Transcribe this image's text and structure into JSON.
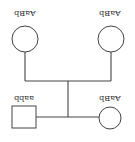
{
  "diagram": {
    "type": "pedigree",
    "orientation": "rotated-180",
    "colors": {
      "line": "#444444",
      "text": "#333333",
      "background": "#ffffff"
    },
    "parents": [
      {
        "id": "parent-left",
        "shape": "circle",
        "genotype": "AaBb"
      },
      {
        "id": "parent-right",
        "shape": "circle",
        "genotype": "AaBb"
      }
    ],
    "children": [
      {
        "id": "child-left",
        "shape": "square",
        "genotype": "aabb"
      },
      {
        "id": "child-right",
        "shape": "circle",
        "genotype": "AaBb"
      }
    ]
  }
}
